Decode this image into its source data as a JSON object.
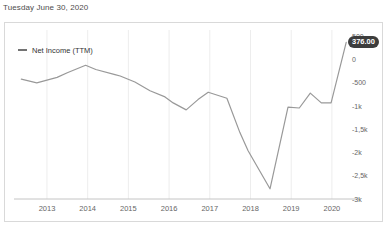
{
  "header": {
    "date_label": "Tuesday June 30, 2020"
  },
  "legend": {
    "label": "Net Income (TTM)"
  },
  "value_badge": {
    "label": "376.00"
  },
  "colors": {
    "line": "#999999",
    "grid": "#ededed",
    "axis": "#c4c4c4",
    "tick_text": "#666666",
    "date_text": "#4d4d4d",
    "legend_text": "#333333",
    "legend_dash": "#737373",
    "badge_bg": "#3d3d3d",
    "badge_text": "#ffffff",
    "card_border": "#d9d9d9",
    "background": "#ffffff"
  },
  "chart_data": {
    "type": "line",
    "title": "Net Income (TTM)",
    "legend_position": "top-left",
    "grid": "vertical",
    "x_axis": {
      "lim": [
        2012.19,
        2020.69
      ],
      "ticks": [
        2013,
        2014,
        2015,
        2016,
        2017,
        2018,
        2019,
        2020
      ],
      "labels": [
        "2013",
        "2014",
        "2015",
        "2016",
        "2017",
        "2018",
        "2019",
        "2020"
      ]
    },
    "y_axis": {
      "side": "right",
      "lim": [
        -3000,
        500
      ],
      "ticks": [
        500,
        0,
        -500,
        -1000,
        -1500,
        -2000,
        -2500,
        -3000
      ],
      "labels": [
        "500",
        "0",
        "-500",
        "-1k",
        "-1,5k",
        "-2k",
        "-2,5k",
        "-3k"
      ]
    },
    "series": [
      {
        "name": "Net Income (TTM)",
        "color": "#999999",
        "x": [
          2012.37,
          2012.75,
          2013.25,
          2013.5,
          2013.95,
          2014.2,
          2014.67,
          2014.8,
          2015.16,
          2015.53,
          2015.9,
          2016.1,
          2016.42,
          2016.71,
          2016.96,
          2017.42,
          2017.74,
          2017.94,
          2018.48,
          2018.92,
          2019.2,
          2019.47,
          2019.74,
          2019.98,
          2020.35
        ],
        "values": [
          -420,
          -500,
          -380,
          -280,
          -120,
          -210,
          -320,
          -350,
          -480,
          -670,
          -800,
          -930,
          -1080,
          -860,
          -700,
          -830,
          -1570,
          -1960,
          -2780,
          -1020,
          -1040,
          -720,
          -930,
          -930,
          376
        ]
      }
    ],
    "last_value": 376.0,
    "last_value_label": "376.00"
  }
}
